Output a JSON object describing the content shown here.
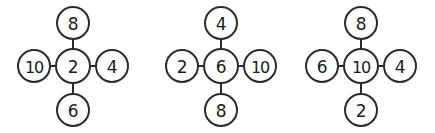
{
  "page": {
    "background_color": "#ffffff",
    "stroke_color": "#2b2b2b",
    "text_color": "#1a1a1a"
  },
  "clusters": [
    {
      "name": "cluster-1",
      "center": "2",
      "top": "8",
      "left": "10",
      "right": "4",
      "bottom": "6"
    },
    {
      "name": "cluster-2",
      "center": "6",
      "top": "4",
      "left": "2",
      "right": "10",
      "bottom": "8"
    },
    {
      "name": "cluster-3",
      "center": "10",
      "top": "8",
      "left": "6",
      "right": "4",
      "bottom": "2"
    }
  ]
}
